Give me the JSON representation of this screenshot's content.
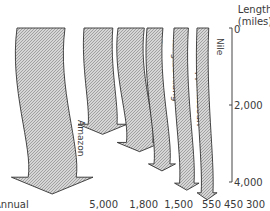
{
  "chart_data": {
    "type": "flow-arrows",
    "title": "",
    "scale_label": [
      "Length",
      "(miles)"
    ],
    "scale_ticks": [
      "0",
      "2,000",
      "4,000"
    ],
    "scale_range": [
      0,
      4000
    ],
    "bottom_row_label": "Annual",
    "rivers": [
      {
        "name": "Amazon",
        "annual_flow": "5,000",
        "flow_value": 5000,
        "length_miles": 4000
      },
      {
        "name": "La Plata",
        "annual_flow": "1,800",
        "flow_value": 1800,
        "length_miles": 2450
      },
      {
        "name": "Congo",
        "annual_flow": "1,500",
        "flow_value": 1500,
        "length_miles": 2900
      },
      {
        "name": "Yangtze-Kiang",
        "annual_flow": "550",
        "flow_value": 550,
        "length_miles": 3400
      },
      {
        "name": "Mississippi-Missouri",
        "annual_flow": "450",
        "flow_value": 450,
        "length_miles": 3900
      },
      {
        "name": "Nile",
        "annual_flow": "300",
        "flow_value": 300,
        "length_miles": 4150
      }
    ]
  }
}
